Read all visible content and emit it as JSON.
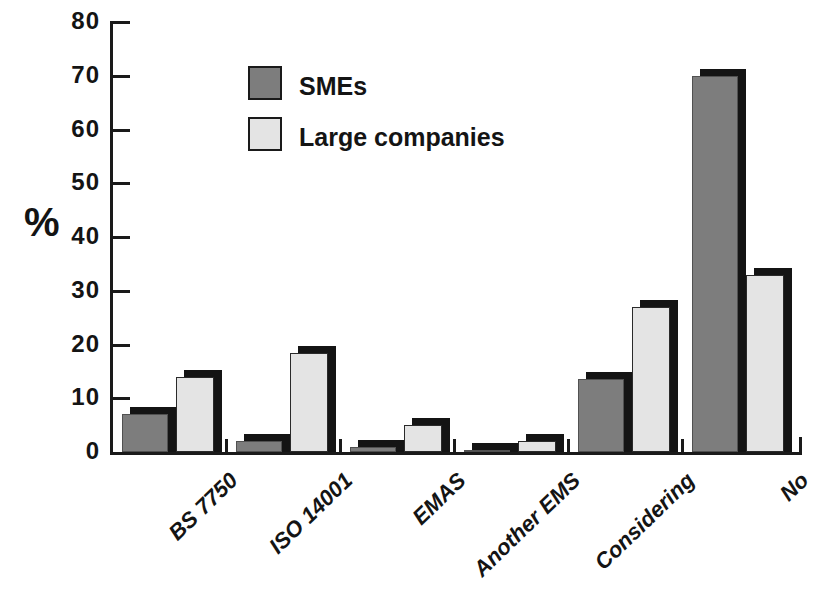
{
  "chart_data": {
    "type": "bar",
    "title": "",
    "xlabel": "",
    "ylabel": "%",
    "ylim": [
      0,
      80
    ],
    "yticks": [
      0,
      10,
      20,
      30,
      40,
      50,
      60,
      70,
      80
    ],
    "grid": false,
    "legend_position": "upper-left-inside",
    "categories": [
      "BS 7750",
      "ISO 14001",
      "EMAS",
      "Another EMS",
      "Considering",
      "No"
    ],
    "series": [
      {
        "name": "SMEs",
        "color": "#7d7d7d",
        "values": [
          7,
          2,
          1,
          0.3,
          13.5,
          70
        ]
      },
      {
        "name": "Large companies",
        "color": "#e4e4e4",
        "values": [
          14,
          18.5,
          5,
          2,
          27,
          33
        ]
      }
    ],
    "bar_shadow_color": "#141414",
    "axis_color": "#1a1a1a",
    "text_color": "#141414"
  }
}
